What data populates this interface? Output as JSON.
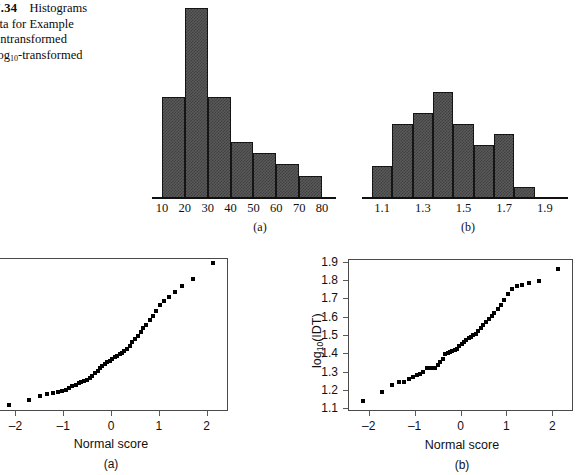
{
  "figure": {
    "caption_number": "7.34",
    "caption_line1": "Histograms",
    "caption_line2": "ata for Example",
    "caption_line3": "untransformed",
    "caption_line4_pre": "log",
    "caption_line4_sub": "10",
    "caption_line4_post": "-transformed"
  },
  "chart_data": [
    {
      "id": "histogram-a",
      "type": "bar",
      "title": "",
      "panel_label": "(a)",
      "xlabel": "",
      "ylabel": "",
      "bin_edges": [
        10,
        20,
        30,
        40,
        50,
        60,
        70,
        80
      ],
      "tick_labels": [
        "10",
        "20",
        "30",
        "40",
        "50",
        "60",
        "70",
        "80"
      ],
      "categories": [
        "10-20",
        "20-30",
        "30-40",
        "40-50",
        "50-60",
        "60-70",
        "70-80"
      ],
      "values": [
        9,
        17,
        9,
        5,
        4,
        3,
        2
      ],
      "ylim": [
        0,
        17
      ],
      "grid": false,
      "bar_fill": "#5a5a5a",
      "bar_edge": "#151515"
    },
    {
      "id": "histogram-b",
      "type": "bar",
      "title": "",
      "panel_label": "(b)",
      "xlabel": "",
      "ylabel": "",
      "bin_edges": [
        1.05,
        1.15,
        1.25,
        1.35,
        1.45,
        1.55,
        1.65,
        1.75,
        1.85,
        1.95
      ],
      "tick_labels": [
        "1.1",
        "1.3",
        "1.5",
        "1.7",
        "1.9"
      ],
      "tick_values": [
        1.1,
        1.3,
        1.5,
        1.7,
        1.9
      ],
      "categories": [
        "1.05-1.15",
        "1.15-1.25",
        "1.25-1.35",
        "1.35-1.45",
        "1.45-1.55",
        "1.55-1.65",
        "1.65-1.75",
        "1.75-1.85"
      ],
      "values": [
        3,
        7,
        8,
        10,
        7,
        5,
        6,
        1
      ],
      "ylim": [
        0,
        10
      ],
      "grid": false,
      "bar_fill": "#5a5a5a",
      "bar_edge": "#151515"
    },
    {
      "id": "normal-plot-a",
      "type": "scatter",
      "title": "",
      "panel_label": "(a)",
      "xlabel": "Normal score",
      "ylabel": "",
      "xlim": [
        -2.45,
        2.45
      ],
      "ylim": [
        0,
        1
      ],
      "xticks": [
        -2,
        -1,
        0,
        1,
        2
      ],
      "xtick_labels": [
        "–2",
        "–1",
        "0",
        "1",
        "2"
      ],
      "yticks": [],
      "ytick_labels": [],
      "grid": false,
      "note": "y-axis labels cropped off left edge of screenshot",
      "x": [
        -2.13,
        -1.71,
        -1.49,
        -1.33,
        -1.22,
        -1.12,
        -1.03,
        -0.95,
        -0.88,
        -0.81,
        -0.74,
        -0.68,
        -0.62,
        -0.56,
        -0.5,
        -0.45,
        -0.39,
        -0.34,
        -0.28,
        -0.23,
        -0.18,
        -0.13,
        -0.08,
        -0.03,
        0.03,
        0.08,
        0.13,
        0.18,
        0.23,
        0.28,
        0.34,
        0.39,
        0.45,
        0.5,
        0.56,
        0.62,
        0.68,
        0.74,
        0.81,
        0.88,
        0.95,
        1.03,
        1.12,
        1.22,
        1.33,
        1.49,
        1.71,
        2.13
      ],
      "y": [
        0.04,
        0.07,
        0.095,
        0.108,
        0.115,
        0.123,
        0.13,
        0.14,
        0.152,
        0.163,
        0.172,
        0.18,
        0.19,
        0.196,
        0.202,
        0.215,
        0.232,
        0.248,
        0.262,
        0.278,
        0.292,
        0.305,
        0.318,
        0.33,
        0.342,
        0.352,
        0.362,
        0.372,
        0.38,
        0.392,
        0.408,
        0.425,
        0.448,
        0.47,
        0.492,
        0.515,
        0.54,
        0.565,
        0.592,
        0.622,
        0.655,
        0.692,
        0.722,
        0.748,
        0.775,
        0.818,
        0.862,
        0.968
      ]
    },
    {
      "id": "normal-plot-b",
      "type": "scatter",
      "title": "",
      "panel_label": "(b)",
      "xlabel": "Normal score",
      "ylabel": "log10(IDT)",
      "ylabel_pre": "log",
      "ylabel_sub": "10",
      "ylabel_post": "(IDT)",
      "xlim": [
        -2.45,
        2.45
      ],
      "ylim": [
        1.085,
        1.915
      ],
      "xticks": [
        -2,
        -1,
        0,
        1,
        2
      ],
      "xtick_labels": [
        "–2",
        "–1",
        "0",
        "1",
        "2"
      ],
      "yticks": [
        1.1,
        1.2,
        1.3,
        1.4,
        1.5,
        1.6,
        1.7,
        1.8,
        1.9
      ],
      "ytick_labels": [
        "1.1",
        "1.2",
        "1.3",
        "1.4",
        "1.5",
        "1.6",
        "1.7",
        "1.8",
        "1.9"
      ],
      "grid": false,
      "x": [
        -2.13,
        -1.71,
        -1.49,
        -1.33,
        -1.22,
        -1.12,
        -1.03,
        -0.95,
        -0.88,
        -0.81,
        -0.74,
        -0.68,
        -0.62,
        -0.56,
        -0.5,
        -0.45,
        -0.39,
        -0.34,
        -0.28,
        -0.23,
        -0.18,
        -0.13,
        -0.08,
        -0.03,
        0.03,
        0.08,
        0.13,
        0.18,
        0.23,
        0.28,
        0.34,
        0.39,
        0.45,
        0.5,
        0.56,
        0.62,
        0.68,
        0.74,
        0.81,
        0.88,
        0.95,
        1.03,
        1.12,
        1.22,
        1.33,
        1.49,
        1.71,
        2.13
      ],
      "y": [
        1.137,
        1.188,
        1.228,
        1.241,
        1.246,
        1.262,
        1.272,
        1.281,
        1.289,
        1.298,
        1.318,
        1.319,
        1.32,
        1.321,
        1.338,
        1.352,
        1.371,
        1.398,
        1.404,
        1.408,
        1.413,
        1.418,
        1.424,
        1.441,
        1.452,
        1.461,
        1.471,
        1.482,
        1.491,
        1.498,
        1.508,
        1.521,
        1.538,
        1.552,
        1.571,
        1.588,
        1.602,
        1.622,
        1.64,
        1.662,
        1.69,
        1.722,
        1.752,
        1.766,
        1.772,
        1.786,
        1.795,
        1.862
      ]
    }
  ]
}
